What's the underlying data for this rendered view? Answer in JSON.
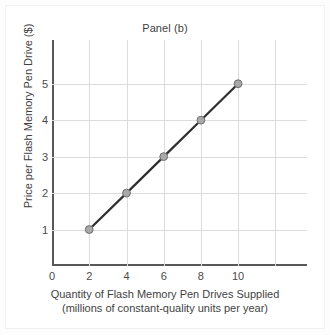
{
  "chart_data": {
    "type": "line",
    "title": "Panel (b)",
    "xlabel": "Quantity of Flash Memory Pen Drives Supplied",
    "xlabel_line2": "(millions of constant-quality units per year)",
    "ylabel": "Price per Flash Memory Pen Drive ($)",
    "x": [
      2,
      4,
      6,
      8,
      10
    ],
    "values": [
      1,
      2,
      3,
      4,
      5
    ],
    "series": [
      {
        "name": "Supply",
        "points": [
          {
            "x": 2,
            "y": 1
          },
          {
            "x": 4,
            "y": 2
          },
          {
            "x": 6,
            "y": 3
          },
          {
            "x": 8,
            "y": 4
          },
          {
            "x": 10,
            "y": 5
          }
        ]
      }
    ],
    "xlim": [
      0,
      13.7
    ],
    "ylim": [
      0,
      6.2
    ],
    "xticks": [
      0,
      2,
      4,
      6,
      8,
      10
    ],
    "xtick_labels": [
      "0",
      "2",
      "4",
      "6",
      "8",
      "10"
    ],
    "yticks": [
      1,
      2,
      3,
      4,
      5
    ],
    "ytick_labels": [
      "1",
      "2",
      "3",
      "4",
      "5"
    ],
    "grid": true,
    "grid_x_values": [
      2,
      4,
      6,
      8,
      10,
      12
    ],
    "grid_y_values": [
      1,
      2,
      3,
      4,
      5
    ],
    "legend": false,
    "legend_position": "none",
    "marker": "circle",
    "colors": {
      "line": "#2f2f2f",
      "marker_fill": "#a9a9a9",
      "marker_edge": "#6e6e6e",
      "axis": "#585858",
      "grid": "#dcdcdc",
      "text": "#3f3f3f",
      "background": "#ffffff"
    }
  }
}
